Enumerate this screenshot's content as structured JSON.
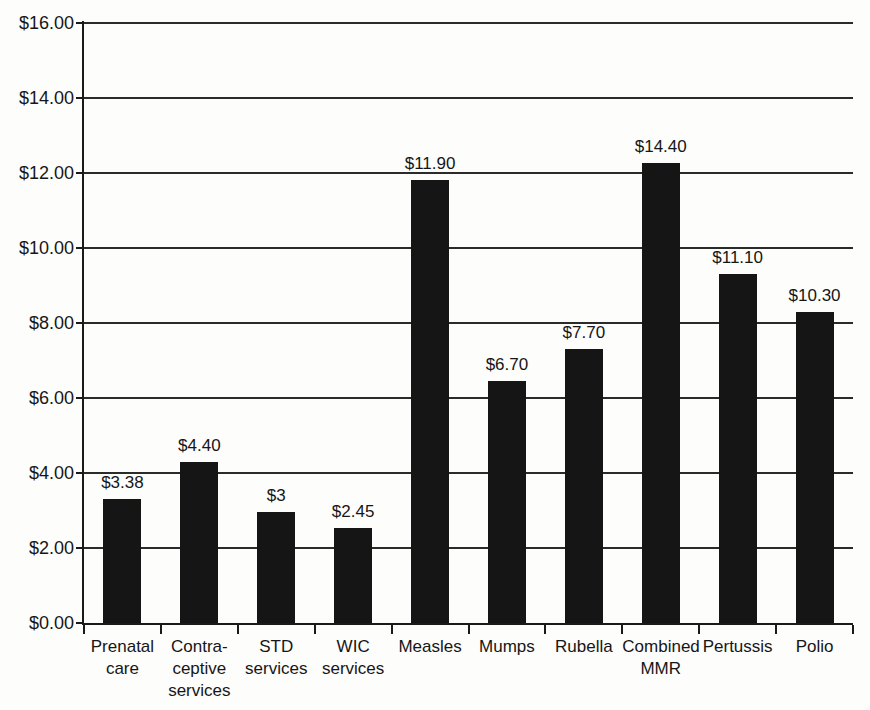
{
  "figure": {
    "background_color": "#fdfdfc",
    "title": ""
  },
  "chart_data": {
    "type": "bar",
    "categories": [
      "Prenatal care",
      "Contraceptive services",
      "STD services",
      "WIC services",
      "Measles",
      "Mumps",
      "Rubella",
      "Combined MMR",
      "Pertussis",
      "Polio"
    ],
    "category_label_lines": [
      [
        "Prenatal",
        "care"
      ],
      [
        "Contra-",
        "ceptive",
        "services"
      ],
      [
        "STD",
        "services"
      ],
      [
        "WIC",
        "services"
      ],
      [
        "Measles"
      ],
      [
        "Mumps"
      ],
      [
        "Rubella"
      ],
      [
        "Combined",
        "MMR"
      ],
      [
        "Pertussis"
      ],
      [
        "Polio"
      ]
    ],
    "values": [
      3.38,
      4.4,
      3.0,
      2.45,
      11.9,
      6.7,
      7.7,
      14.4,
      11.1,
      10.3
    ],
    "value_labels": [
      "$3.38",
      "$4.40",
      "$3",
      "$2.45",
      "$11.90",
      "$6.70",
      "$7.70",
      "$14.40",
      "$11.10",
      "$10.30"
    ],
    "bar_heights_as_drawn": [
      3.31,
      4.29,
      2.96,
      2.53,
      11.81,
      6.45,
      7.31,
      12.27,
      9.31,
      8.29
    ],
    "ylim": [
      0,
      16
    ],
    "ytick_values": [
      0,
      2,
      4,
      6,
      8,
      10,
      12,
      14,
      16
    ],
    "ytick_labels": [
      "$0.00",
      "$2.00",
      "$4.00",
      "$6.00",
      "$8.00",
      "$10.00",
      "$12.00",
      "$14.00",
      "$16.00"
    ],
    "grid": true,
    "legend": "none",
    "xlabel": "",
    "ylabel": "",
    "bar_color": "#151515",
    "axis_color": "#1a1a1a",
    "gridline_color": "#2b2b2b",
    "text_color": "#161616"
  }
}
